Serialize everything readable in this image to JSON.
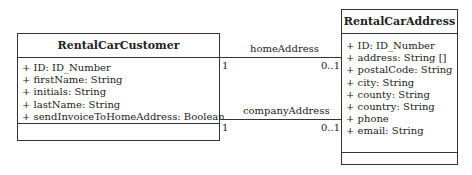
{
  "diagram": {
    "type": "UML class diagram",
    "classes": [
      {
        "name": "RentalCarCustomer",
        "attributes": [
          "+ ID: ID_Number",
          "+ firstName: String",
          "+ initials: String",
          "+ lastName: String",
          "+ sendInvoiceToHomeAddress: Boolean"
        ],
        "operations": []
      },
      {
        "name": "RentalCarAddress",
        "attributes": [
          "+ ID: ID_Number",
          "+ address: String []",
          "+ postalCode: String",
          "+ city: String",
          "+ county: String",
          "+ country: String",
          "+ phone",
          "+ email: String"
        ],
        "operations": []
      }
    ],
    "associations": [
      {
        "role": "homeAddress",
        "source_multiplicity": "1",
        "target_multiplicity": "0..1"
      },
      {
        "role": "companyAddress",
        "source_multiplicity": "1",
        "target_multiplicity": "0..1"
      }
    ]
  }
}
